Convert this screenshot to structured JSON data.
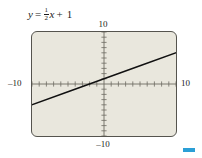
{
  "equation": {
    "lhs": "y",
    "equals": "=",
    "coefficient_numerator": "1",
    "coefficient_denominator": "2",
    "variable": "x",
    "plus": "+",
    "constant": "1",
    "full_text": "y = 1/2 x + 1"
  },
  "axis_labels": {
    "top": "10",
    "bottom": "–10",
    "left": "–10",
    "right": "10"
  },
  "colors": {
    "plot_background": "#e9e7dd",
    "frame_border": "#55544e",
    "axis": "#6e6c63",
    "curve": "#111111",
    "page_background": "#ffffff",
    "marker_blue": "#2b9fd6"
  },
  "marker": {
    "name": "blue-swatch"
  },
  "chart_data": {
    "type": "line",
    "xlabel": "",
    "ylabel": "",
    "xlim": [
      -10,
      10
    ],
    "ylim": [
      -10,
      10
    ],
    "grid": false,
    "axes_style": "graphing-calculator-viewing-window",
    "tick_spacing": 1,
    "x_ticks": [
      -10,
      -9,
      -8,
      -7,
      -6,
      -5,
      -4,
      -3,
      -2,
      -1,
      0,
      1,
      2,
      3,
      4,
      5,
      6,
      7,
      8,
      9,
      10
    ],
    "y_ticks": [
      -10,
      -9,
      -8,
      -7,
      -6,
      -5,
      -4,
      -3,
      -2,
      -1,
      0,
      1,
      2,
      3,
      4,
      5,
      6,
      7,
      8,
      9,
      10
    ],
    "tick_labels_shown": [
      "10",
      "–10",
      "–10",
      "10"
    ],
    "series": [
      {
        "name": "y = 1/2 x + 1",
        "equation": "y = 0.5x + 1",
        "slope": 0.5,
        "intercept": 1,
        "x": [
          -10,
          -5,
          0,
          5,
          10
        ],
        "values": [
          -4,
          -1.5,
          1,
          3.5,
          6
        ]
      }
    ],
    "annotations": [
      {
        "text": "y = 1/2 x + 1",
        "position": "above-plot-left"
      }
    ],
    "legend": null
  }
}
